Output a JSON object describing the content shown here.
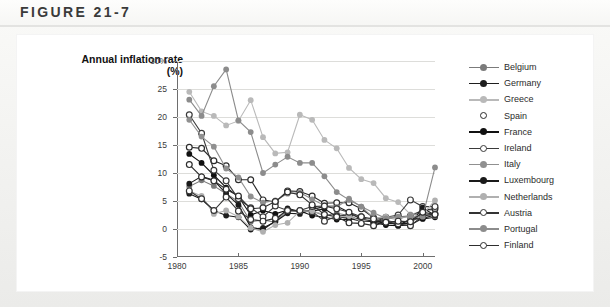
{
  "figure": {
    "label": "FIGURE 21-7"
  },
  "chart_data": {
    "type": "line",
    "title": "Annual inflation rate\n(%)",
    "ylabel": "Annual inflation rate (%)",
    "xlabel": "",
    "ylim": [
      -5,
      30
    ],
    "xlim": [
      1980,
      2001
    ],
    "ytick_labels": [
      "30%",
      "25",
      "20",
      "15",
      "10",
      "5",
      "0",
      "-5"
    ],
    "ytick_values": [
      30,
      25,
      20,
      15,
      10,
      5,
      0,
      -5
    ],
    "xtick_labels": [
      "1980",
      "1985",
      "1990",
      "1995",
      "2000"
    ],
    "xtick_values": [
      1980,
      1985,
      1990,
      1995,
      2000
    ],
    "grid": true,
    "legend_position": "right",
    "x": [
      1981,
      1982,
      1983,
      1984,
      1985,
      1986,
      1987,
      1988,
      1989,
      1990,
      1991,
      1992,
      1993,
      1994,
      1995,
      1996,
      1997,
      1998,
      1999,
      2000,
      2001
    ],
    "series": [
      {
        "name": "Belgium",
        "color": "#7b7b7b",
        "marker": "filled",
        "values": [
          7.6,
          8.7,
          7.7,
          6.3,
          4.9,
          1.3,
          1.6,
          1.2,
          3.1,
          3.4,
          3.2,
          2.4,
          2.8,
          2.4,
          1.5,
          2.1,
          1.6,
          1.0,
          1.1,
          2.7,
          2.4
        ]
      },
      {
        "name": "Germany",
        "color": "#1e1e1e",
        "marker": "filled",
        "values": [
          6.3,
          5.3,
          3.3,
          2.4,
          2.1,
          -0.1,
          0.2,
          1.3,
          2.8,
          2.7,
          3.5,
          4.0,
          4.1,
          3.0,
          1.7,
          1.2,
          1.5,
          0.6,
          0.7,
          1.9,
          2.5
        ]
      },
      {
        "name": "Greece",
        "color": "#b9b9b9",
        "marker": "filled",
        "values": [
          24.5,
          21.0,
          20.2,
          18.5,
          19.3,
          23.0,
          16.4,
          13.5,
          13.7,
          20.4,
          19.5,
          15.9,
          14.4,
          10.9,
          8.9,
          8.2,
          5.5,
          4.8,
          2.6,
          3.2,
          3.4
        ]
      },
      {
        "name": "Spain",
        "color": "#2b2b2b",
        "marker": "open",
        "values": [
          14.6,
          14.4,
          12.2,
          11.3,
          8.8,
          8.8,
          5.2,
          4.8,
          6.8,
          6.7,
          5.9,
          4.6,
          4.7,
          4.7,
          3.6,
          2.0,
          1.9,
          2.2,
          2.3,
          3.4,
          3.6
        ]
      },
      {
        "name": "France",
        "color": "#111111",
        "marker": "filled",
        "values": [
          13.4,
          11.8,
          9.6,
          7.4,
          5.8,
          2.5,
          3.3,
          2.7,
          3.4,
          3.2,
          2.4,
          2.1,
          1.7,
          1.7,
          2.0,
          1.2,
          0.7,
          0.6,
          1.8,
          1.8,
          2.1
        ]
      },
      {
        "name": "Ireland",
        "color": "#3a3a3a",
        "marker": "open",
        "values": [
          20.4,
          17.1,
          10.5,
          8.6,
          5.4,
          3.8,
          2.2,
          4.1,
          3.3,
          3.2,
          3.1,
          1.4,
          2.3,
          2.5,
          2.2,
          1.2,
          2.1,
          2.5,
          5.2,
          4.0,
          4.0
        ]
      },
      {
        "name": "Italy",
        "color": "#909090",
        "marker": "filled",
        "values": [
          19.5,
          16.5,
          14.7,
          10.8,
          9.2,
          5.8,
          4.7,
          5.1,
          6.3,
          6.5,
          5.3,
          4.2,
          3.9,
          5.4,
          4.0,
          2.0,
          2.0,
          1.7,
          2.5,
          2.8,
          2.3
        ]
      },
      {
        "name": "Luxembourg",
        "color": "#1a1a1a",
        "marker": "filled",
        "values": [
          8.1,
          9.4,
          8.7,
          6.3,
          4.3,
          0.3,
          -0.1,
          1.4,
          3.7,
          3.1,
          3.2,
          3.6,
          2.2,
          1.9,
          1.4,
          1.4,
          1.0,
          1.0,
          1.0,
          3.8,
          2.4
        ]
      },
      {
        "name": "Netherlands",
        "color": "#b0b0b0",
        "marker": "filled",
        "values": [
          6.8,
          5.9,
          2.7,
          3.3,
          2.2,
          0.2,
          -0.5,
          0.7,
          1.1,
          3.2,
          3.2,
          2.6,
          2.1,
          2.3,
          1.4,
          1.9,
          2.2,
          2.0,
          2.2,
          2.6,
          5.1
        ]
      },
      {
        "name": "Austria",
        "color": "#333333",
        "marker": "open",
        "values": [
          6.8,
          5.4,
          3.3,
          5.7,
          3.2,
          1.7,
          1.4,
          1.9,
          3.3,
          3.3,
          4.0,
          4.1,
          3.6,
          3.0,
          2.2,
          1.8,
          1.3,
          0.9,
          0.6,
          2.3,
          2.7
        ]
      },
      {
        "name": "Portugal",
        "color": "#8c8c8c",
        "marker": "filled",
        "values": [
          23.1,
          20.2,
          25.5,
          28.5,
          19.4,
          17.3,
          10.0,
          11.5,
          12.9,
          11.8,
          11.8,
          9.4,
          6.6,
          5.2,
          4.0,
          2.9,
          1.9,
          2.2,
          2.2,
          2.2,
          11.0
        ]
      },
      {
        "name": "Finland",
        "color": "#2e2e2e",
        "marker": "open",
        "values": [
          11.5,
          9.3,
          8.6,
          7.1,
          5.9,
          3.6,
          3.8,
          4.9,
          6.6,
          6.1,
          4.3,
          2.6,
          2.2,
          1.1,
          1.0,
          0.6,
          1.2,
          1.4,
          1.3,
          3.0,
          2.6
        ]
      }
    ]
  }
}
